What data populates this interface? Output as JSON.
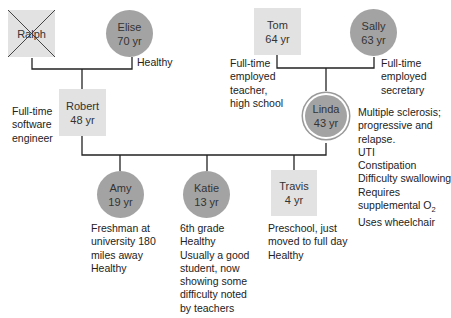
{
  "genogram": {
    "colors": {
      "male_fill": "#e2e2e2",
      "female_fill": "#a3a3a3",
      "line": "#222222"
    },
    "people": {
      "ralph": {
        "name": "Ralph",
        "age": "",
        "deceased": true
      },
      "elise": {
        "name": "Elise",
        "age": "70 yr",
        "note": "Healthy"
      },
      "robert": {
        "name": "Robert",
        "age": "48 yr",
        "note": [
          "Full-time",
          "software",
          "engineer"
        ]
      },
      "tom": {
        "name": "Tom",
        "age": "64 yr",
        "note": [
          "Full-time",
          "employed",
          "teacher,",
          "high school"
        ]
      },
      "sally": {
        "name": "Sally",
        "age": "63 yr",
        "note": [
          "Full-time",
          "employed",
          "secretary"
        ]
      },
      "linda": {
        "name": "Linda",
        "age": "43 yr",
        "identified_patient": true,
        "note": [
          "Multiple sclerosis;",
          "progressive and",
          "relapse.",
          "UTI",
          "Constipation",
          "Difficulty swallowing",
          "Requires",
          "supplemental O",
          "Uses wheelchair"
        ],
        "o2_subscript": "2"
      },
      "amy": {
        "name": "Amy",
        "age": "19 yr",
        "note": [
          "Freshman at",
          "university 180",
          "miles away",
          "Healthy"
        ]
      },
      "katie": {
        "name": "Katie",
        "age": "13 yr",
        "note": [
          "6th grade",
          "Healthy",
          "Usually a good",
          "student, now",
          "showing some",
          "difficulty noted",
          "by teachers"
        ]
      },
      "travis": {
        "name": "Travis",
        "age": "4 yr",
        "note": [
          "Preschool, just",
          "moved to full day",
          "Healthy"
        ]
      }
    }
  }
}
